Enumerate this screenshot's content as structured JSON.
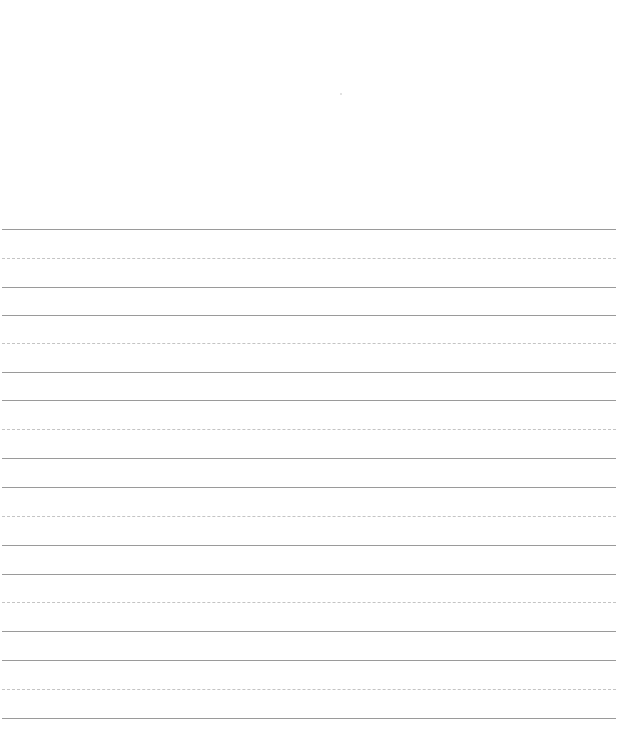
{
  "page": {
    "type": "handwriting-practice-sheet",
    "background": "#ffffff",
    "solid_line_color": "#9a9a9a",
    "dashed_line_color": "#c4c4c4",
    "line_left": 2,
    "line_width": 614
  },
  "groups": [
    {
      "top": 229,
      "mid": 258,
      "base": 287
    },
    {
      "top": 315,
      "mid": 343,
      "base": 372
    },
    {
      "top": 400,
      "mid": 429,
      "base": 458
    },
    {
      "top": 487,
      "mid": 516,
      "base": 545
    },
    {
      "top": 574,
      "mid": 602,
      "base": 631
    },
    {
      "top": 660,
      "mid": 689,
      "base": 718
    }
  ]
}
